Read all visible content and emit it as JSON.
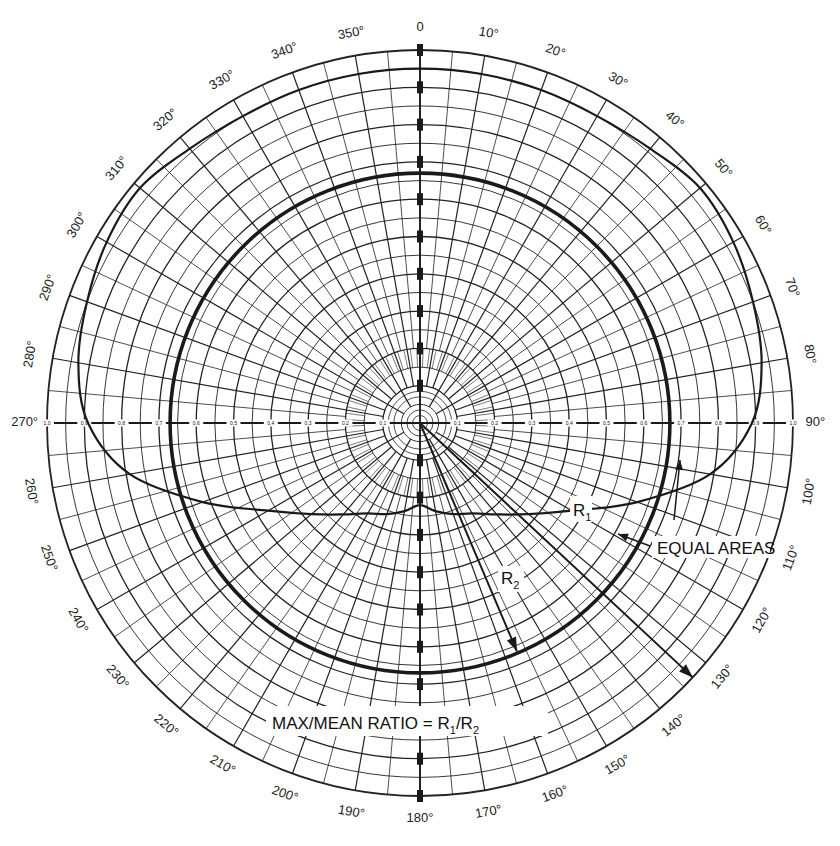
{
  "chart_data": {
    "type": "polar",
    "title": "",
    "angular_axis": {
      "direction": "clockwise",
      "zero_at": "top",
      "tick_labels": [
        "0",
        "10°",
        "20°",
        "30°",
        "40°",
        "50°",
        "60°",
        "70°",
        "80°",
        "90°",
        "100°",
        "110°",
        "120°",
        "130°",
        "140°",
        "150°",
        "160°",
        "170°",
        "180°",
        "190°",
        "200°",
        "210°",
        "220°",
        "230°",
        "240°",
        "250°",
        "260°",
        "270°",
        "280°",
        "290°",
        "300°",
        "310°",
        "320°",
        "330°",
        "340°",
        "350°"
      ]
    },
    "radial_axis": {
      "range": [
        0,
        1.0
      ],
      "tick_labels": [
        "0.1",
        "0.2",
        "0.3",
        "0.4",
        "0.5",
        "0.6",
        "0.7",
        "0.8",
        "0.9",
        "1.0"
      ],
      "grid": true
    },
    "series": [
      {
        "name": "Distribution curve",
        "style": "medium",
        "theta": [
          0,
          10,
          20,
          30,
          40,
          50,
          60,
          70,
          80,
          90,
          100,
          110,
          120,
          130,
          140,
          150,
          160,
          170,
          180,
          190,
          200,
          210,
          220,
          230,
          240,
          250,
          260,
          270,
          280,
          290,
          300,
          310,
          320,
          330,
          340,
          350
        ],
        "r": [
          0.95,
          0.95,
          0.95,
          0.95,
          0.96,
          0.98,
          0.97,
          0.95,
          0.93,
          0.89,
          0.79,
          0.62,
          0.47,
          0.38,
          0.32,
          0.28,
          0.26,
          0.24,
          0.22,
          0.24,
          0.26,
          0.28,
          0.32,
          0.38,
          0.47,
          0.62,
          0.79,
          0.89,
          0.93,
          0.95,
          0.97,
          0.98,
          0.96,
          0.95,
          0.95,
          0.95
        ]
      },
      {
        "name": "Mean circle (equal area)",
        "style": "thick",
        "r_constant": 0.67
      }
    ],
    "annotations": [
      {
        "text": "EQUAL AREAS",
        "arrow_to_theta": 118,
        "arrow_to_r": 0.62
      },
      {
        "text": "R1",
        "description": "arrow from center at 135° to outer rim (max)"
      },
      {
        "text": "R2",
        "description": "arrow from center at 150° to mean circle"
      },
      {
        "text": "MAX/MEAN RATIO = R1/R2"
      }
    ],
    "legend": null
  },
  "labels": {
    "equal_areas": "EQUAL AREAS",
    "r1_main": "R",
    "r1_sub": "1",
    "r2_main": "R",
    "r2_sub": "2",
    "ratio_prefix": "MAX/MEAN RATIO = R",
    "ratio_sub1": "1",
    "ratio_mid": "/R",
    "ratio_sub2": "2"
  },
  "style": {
    "ink": "#1a1a1a",
    "grid": "#222222",
    "background": "#ffffff"
  }
}
